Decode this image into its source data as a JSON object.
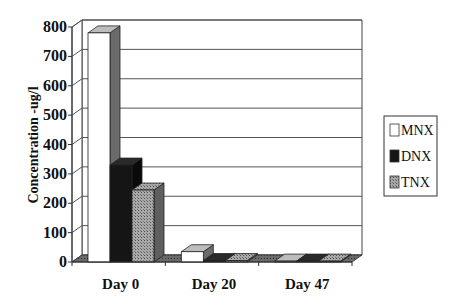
{
  "chart_data": {
    "type": "bar",
    "style": "3d-clustered-column",
    "title": "",
    "xlabel": "",
    "ylabel": "Concentration -ug/l",
    "categories": [
      "Day 0",
      "Day 20",
      "Day 47"
    ],
    "series": [
      {
        "name": "MNX",
        "values": [
          780,
          35,
          3
        ],
        "fill": "#ffffff",
        "side": "#6a6a6a",
        "top": "#b8b8b8"
      },
      {
        "name": "DNX",
        "values": [
          330,
          5,
          3
        ],
        "fill": "#1a1a1a",
        "side": "#0a0a0a",
        "top": "#2a2a2a"
      },
      {
        "name": "TNX",
        "values": [
          245,
          5,
          3
        ],
        "fill": "#9a9a9a",
        "side": "#5a5a5a",
        "top": "#8a8a8a"
      }
    ],
    "ylim": [
      0,
      800
    ],
    "yticks": [
      0,
      100,
      200,
      300,
      400,
      500,
      600,
      700,
      800
    ],
    "grid": true,
    "legend_position": "right"
  },
  "axis": {
    "yticks_labels": [
      "0",
      "100",
      "200",
      "300",
      "400",
      "500",
      "600",
      "700",
      "800"
    ]
  },
  "legend": {
    "items": [
      "MNX",
      "DNX",
      "TNX"
    ]
  }
}
